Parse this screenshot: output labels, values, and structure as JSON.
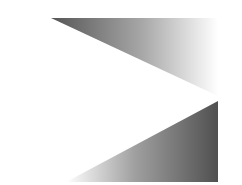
{
  "canvas": {
    "width": 242,
    "height": 185,
    "background": "#ffffff"
  },
  "shapes": [
    {
      "name": "upper-gradient-triangle",
      "points": "51,18 218,18 218,96",
      "gradient": {
        "from": "#5a5a5a",
        "to": "#ffffff",
        "direction": "left-to-right"
      }
    },
    {
      "name": "lower-gradient-triangle",
      "points": "218,101 218,182 66,182",
      "gradient": {
        "from": "#ffffff",
        "to": "#5a5a5a",
        "direction": "left-to-right"
      }
    }
  ]
}
